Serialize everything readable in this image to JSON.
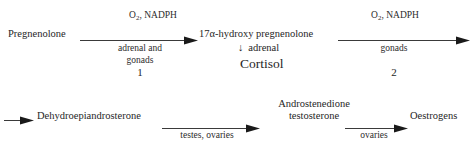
{
  "diagram": {
    "background_color": "#ffffff",
    "line_color": "#3a3a3a",
    "text_color": "#262626",
    "rows": {
      "top": {
        "nodes": {
          "substrate": "Pregnenolone",
          "intermediate": "17α-hydroxy pregnenolone",
          "branch_product": "Cortisol"
        },
        "branch": {
          "arrow_glyph": "↓",
          "site": "adrenal"
        },
        "reaction_1": {
          "cofactors_prefix": "O",
          "cofactors_subscript": "2",
          "cofactors_suffix": ", NADPH",
          "site_line_1": "adrenal and",
          "site_line_2": "gonads",
          "step_number": "1"
        },
        "reaction_2": {
          "cofactors_prefix": "O",
          "cofactors_subscript": "2",
          "cofactors_suffix": ", NADPH",
          "site_line_1": "gonads",
          "step_number": "2"
        }
      },
      "bottom": {
        "nodes": {
          "dhea": "Dehydroepiandrosterone",
          "androgens_line_1": "Androstenedione",
          "androgens_line_2": "testosterone",
          "oestrogens": "Oestrogens"
        },
        "reaction_3": {
          "site_line_1": "testes, ovaries"
        },
        "reaction_4": {
          "site_line_1": "ovaries"
        }
      }
    }
  }
}
